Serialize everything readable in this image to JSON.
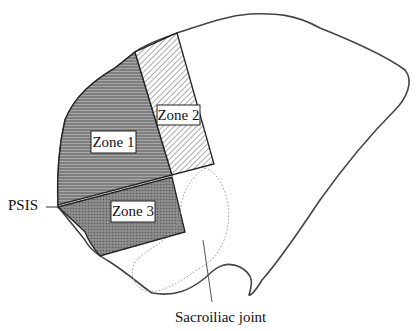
{
  "figure": {
    "zones": [
      {
        "id": "zone1",
        "label": "Zone 1",
        "pattern": "horizontal-lines"
      },
      {
        "id": "zone2",
        "label": "Zone 2",
        "pattern": "diagonal-hatch"
      },
      {
        "id": "zone3",
        "label": "Zone 3",
        "pattern": "dense-crosshatch"
      }
    ],
    "annotations": {
      "psis": "PSIS",
      "sacroiliac": "Sacroiliac joint"
    },
    "colors": {
      "outline": "#444444",
      "zone1_fill": "#8a8a8a",
      "zone2_line": "#555555",
      "zone3_fill": "#7a7a7a",
      "dotted": "#999999"
    }
  }
}
